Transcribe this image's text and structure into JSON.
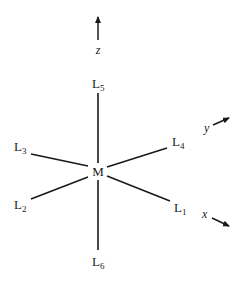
{
  "diagram": {
    "center": {
      "label": "M"
    },
    "ligands": [
      {
        "id": "L1",
        "base": "L",
        "sub": "1",
        "direction": "+x"
      },
      {
        "id": "L2",
        "base": "L",
        "sub": "2",
        "direction": "-y"
      },
      {
        "id": "L3",
        "base": "L",
        "sub": "3",
        "direction": "-x"
      },
      {
        "id": "L4",
        "base": "L",
        "sub": "4",
        "direction": "+y"
      },
      {
        "id": "L5",
        "base": "L",
        "sub": "5",
        "direction": "+z"
      },
      {
        "id": "L6",
        "base": "L",
        "sub": "6",
        "direction": "-z"
      }
    ],
    "axes": [
      {
        "name": "z",
        "label": "z"
      },
      {
        "name": "y",
        "label": "y"
      },
      {
        "name": "x",
        "label": "x"
      }
    ],
    "colors": {
      "ink": "#1a1a1a",
      "background": "#ffffff"
    }
  }
}
